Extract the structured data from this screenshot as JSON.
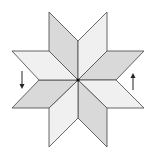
{
  "diagram": {
    "title": "",
    "colors": {
      "background": "#ffffff",
      "stroke": "#555555",
      "dark_fill": "#d9d9d9",
      "light_fill": "#f0f0f0",
      "center_dot": "#111111",
      "arrow": "#222222"
    },
    "center": [
      78,
      80
    ],
    "rhombi": [
      {
        "name": "upper-left",
        "shade": "dark",
        "points": "49,12 78,41 78,80 49,51"
      },
      {
        "name": "upper-right",
        "shade": "light",
        "points": "107,12 78,41 78,80 107,51"
      },
      {
        "name": "right-upper",
        "shade": "dark",
        "points": "107,51 144,51 116,80 78,80"
      },
      {
        "name": "right-lower",
        "shade": "light",
        "points": "78,80 116,80 144,108 107,108"
      },
      {
        "name": "lower-right",
        "shade": "dark",
        "points": "78,80 107,108 107,147 78,118"
      },
      {
        "name": "lower-left",
        "shade": "light",
        "points": "78,80 49,108 49,147 78,118"
      },
      {
        "name": "left-lower",
        "shade": "dark",
        "points": "39,80 78,80 49,108 12,108"
      },
      {
        "name": "left-upper",
        "shade": "light",
        "points": "12,51 49,51 78,80 39,80"
      }
    ],
    "arrows": [
      {
        "name": "left-down-arrow",
        "direction": "down",
        "x": 22,
        "y1": 71,
        "y2": 89
      },
      {
        "name": "right-up-arrow",
        "direction": "up",
        "x": 133,
        "y1": 90,
        "y2": 73
      }
    ]
  }
}
